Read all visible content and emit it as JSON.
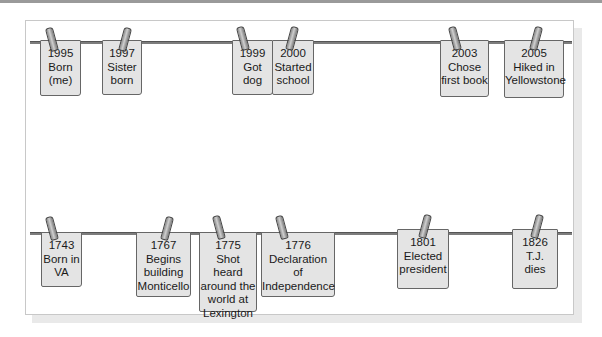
{
  "diagram": {
    "type": "timeline-clothesline",
    "colors": {
      "card_fill": "#e4e4e4",
      "card_border": "#666666",
      "line": "#7d7d7d",
      "panel_border": "#c8c8c8"
    },
    "personal_timeline": {
      "cards": [
        {
          "year": "1995",
          "text": "Born\n(me)"
        },
        {
          "year": "1997",
          "text": "Sister\nborn"
        },
        {
          "year": "1999",
          "text": "Got\ndog"
        },
        {
          "year": "2000",
          "text": "Started\nschool"
        },
        {
          "year": "2003",
          "text": "Chose\nfirst book"
        },
        {
          "year": "2005",
          "text": "Hiked in\nYellowstone"
        }
      ]
    },
    "jefferson_timeline": {
      "cards": [
        {
          "year": "1743",
          "text": "Born in\nVA"
        },
        {
          "year": "1767",
          "text": "Begins\nbuilding\nMonticello"
        },
        {
          "year": "1775",
          "text": "Shot heard\naround the\nworld at\nLexington"
        },
        {
          "year": "1776",
          "text": "Declaration\nof\nIndependence"
        },
        {
          "year": "1801",
          "text": "Elected\npresident"
        },
        {
          "year": "1826",
          "text": "T.J.\ndies"
        }
      ]
    }
  }
}
